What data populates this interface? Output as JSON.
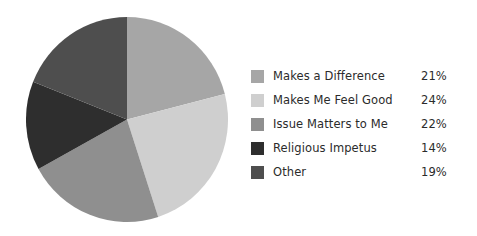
{
  "chart_data": {
    "type": "pie",
    "title": "",
    "subtitle": "",
    "xlabel": "",
    "ylabel": "",
    "legend_position": "right",
    "grid": false,
    "start_angle_deg": 0,
    "direction": "clockwise",
    "categories": [
      "Makes a Difference",
      "Makes Me Feel Good",
      "Issue Matters to Me",
      "Religious Impetus",
      "Other"
    ],
    "values": [
      21,
      24,
      22,
      14,
      19
    ],
    "value_labels": [
      "21%",
      "24%",
      "22%",
      "14%",
      "19%"
    ],
    "colors": [
      "#a6a6a6",
      "#cfcfcf",
      "#8f8f8f",
      "#2e2e2e",
      "#4e4e4e"
    ],
    "units": "percent",
    "total": 100
  },
  "legend": {
    "rows": [
      {
        "label": "Makes a Difference",
        "value": "21%",
        "color": "#a6a6a6"
      },
      {
        "label": "Makes Me Feel Good",
        "value": "24%",
        "color": "#cfcfcf"
      },
      {
        "label": "Issue Matters to Me",
        "value": "22%",
        "color": "#8f8f8f"
      },
      {
        "label": "Religious Impetus",
        "value": "14%",
        "color": "#2e2e2e"
      },
      {
        "label": "Other",
        "value": "19%",
        "color": "#4e4e4e"
      }
    ]
  }
}
